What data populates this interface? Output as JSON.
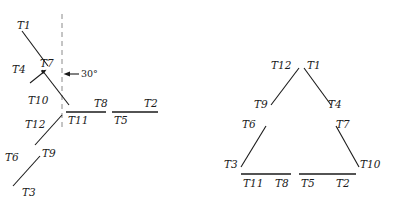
{
  "figure": {
    "title": "",
    "background_color": "#ffffff",
    "stroke_color": "#1a1a1a",
    "dashed_color": "#8a8a8a",
    "width": 394,
    "height": 207
  },
  "annotation": {
    "angle_label": "30°"
  },
  "left_panel": {
    "name": "unfolded-configuration",
    "labels": {
      "t1": "T1",
      "t4": "T4",
      "t7": "T7",
      "t10": "T10",
      "t12": "T12",
      "t9": "T9",
      "t6": "T6",
      "t3": "T3",
      "t11": "T11",
      "t8": "T8",
      "t5": "T5",
      "t2": "T2"
    }
  },
  "right_panel": {
    "name": "triangle-configuration",
    "labels": {
      "t12": "T12",
      "t1": "T1",
      "t9": "T9",
      "t4": "T4",
      "t6": "T6",
      "t7": "T7",
      "t3": "T3",
      "t10": "T10",
      "t11": "T11",
      "t8": "T8",
      "t5": "T5",
      "t2": "T2"
    }
  }
}
